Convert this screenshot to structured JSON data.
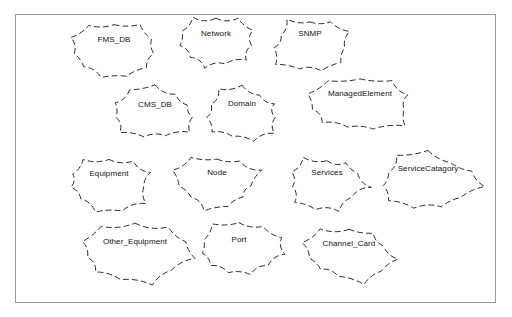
{
  "diagram": {
    "frame": {
      "stroke_color": "#9a9a9a",
      "background": "#ffffff"
    },
    "shape_style": {
      "outline": "dashed",
      "outline_color": "#2a2a2a",
      "fill": "#ffffff",
      "shape": "cloud-blob"
    },
    "nodes": [
      {
        "label": "FMS_DB",
        "x": 67,
        "y": 20,
        "w": 92,
        "h": 58,
        "label_top": 14,
        "seed": 1
      },
      {
        "label": "Network",
        "x": 173,
        "y": 12,
        "w": 84,
        "h": 58,
        "label_top": 16,
        "seed": 2
      },
      {
        "label": "SNMP",
        "x": 267,
        "y": 14,
        "w": 84,
        "h": 58,
        "label_top": 14,
        "seed": 3
      },
      {
        "label": "CMS_DB",
        "x": 108,
        "y": 85,
        "w": 92,
        "h": 56,
        "label_top": 14,
        "seed": 4
      },
      {
        "label": "Domain",
        "x": 199,
        "y": 84,
        "w": 84,
        "h": 58,
        "label_top": 14,
        "seed": 5
      },
      {
        "label": "ManagedElement",
        "x": 302,
        "y": 76,
        "w": 114,
        "h": 58,
        "label_top": 12,
        "seed": 6
      },
      {
        "label": "Equipment",
        "x": 62,
        "y": 155,
        "w": 92,
        "h": 56,
        "label_top": 13,
        "seed": 7
      },
      {
        "label": "Node",
        "x": 170,
        "y": 153,
        "w": 92,
        "h": 58,
        "label_top": 14,
        "seed": 8
      },
      {
        "label": "Services",
        "x": 284,
        "y": 153,
        "w": 84,
        "h": 58,
        "label_top": 14,
        "seed": 9
      },
      {
        "label": "ServiceCatagory",
        "x": 372,
        "y": 151,
        "w": 110,
        "h": 60,
        "label_top": 12,
        "seed": 10
      },
      {
        "label": "Other_Equipment",
        "x": 75,
        "y": 222,
        "w": 118,
        "h": 62,
        "label_top": 14,
        "seed": 11
      },
      {
        "label": "Port",
        "x": 192,
        "y": 220,
        "w": 92,
        "h": 58,
        "label_top": 14,
        "seed": 12
      },
      {
        "label": "Channel_Card",
        "x": 298,
        "y": 225,
        "w": 100,
        "h": 58,
        "label_top": 13,
        "seed": 13
      }
    ]
  }
}
